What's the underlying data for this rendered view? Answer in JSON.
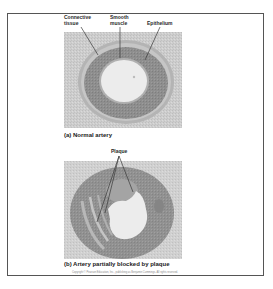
{
  "figure": {
    "panels": [
      {
        "id": "a",
        "caption": "(a) Normal artery",
        "labels": [
          {
            "text_line1": "Connective",
            "text_line2": "tissue"
          },
          {
            "text_line1": "Smooth",
            "text_line2": "muscle"
          },
          {
            "text_line1": "Epithelium",
            "text_line2": ""
          }
        ]
      },
      {
        "id": "b",
        "caption": "(b) Artery partially blocked by plaque",
        "labels": [
          {
            "text_line1": "Plaque",
            "text_line2": ""
          }
        ]
      }
    ],
    "copyright": "Copyright © Pearson Education, Inc., publishing as Benjamin Cummings. All rights reserved."
  },
  "colors": {
    "frame_border": "#555555",
    "tissue_background": "#cfcfcf",
    "artery_wall": "#8f8f8f",
    "lumen": "#ececec",
    "label_line": "#3a3a3a"
  }
}
